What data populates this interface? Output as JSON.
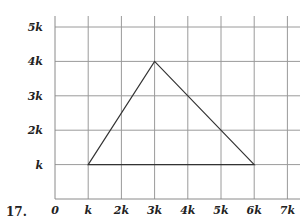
{
  "problem_number": "17.",
  "chart_data": {
    "type": "line",
    "title": "",
    "xlabel": "",
    "ylabel": "",
    "x_ticks": [
      "0",
      "k",
      "2k",
      "3k",
      "4k",
      "5k",
      "6k",
      "7k"
    ],
    "y_ticks": [
      "k",
      "2k",
      "3k",
      "4k",
      "5k"
    ],
    "xlim": [
      0,
      7.4
    ],
    "ylim": [
      0,
      5.5
    ],
    "grid": true,
    "unit": "k",
    "series": [
      {
        "name": "triangle",
        "closed": true,
        "points": [
          {
            "x": 1,
            "y": 1,
            "label": "(k, k)"
          },
          {
            "x": 3,
            "y": 4,
            "label": "(3k, 4k)"
          },
          {
            "x": 6,
            "y": 1,
            "label": "(6k, k)"
          }
        ]
      }
    ]
  }
}
